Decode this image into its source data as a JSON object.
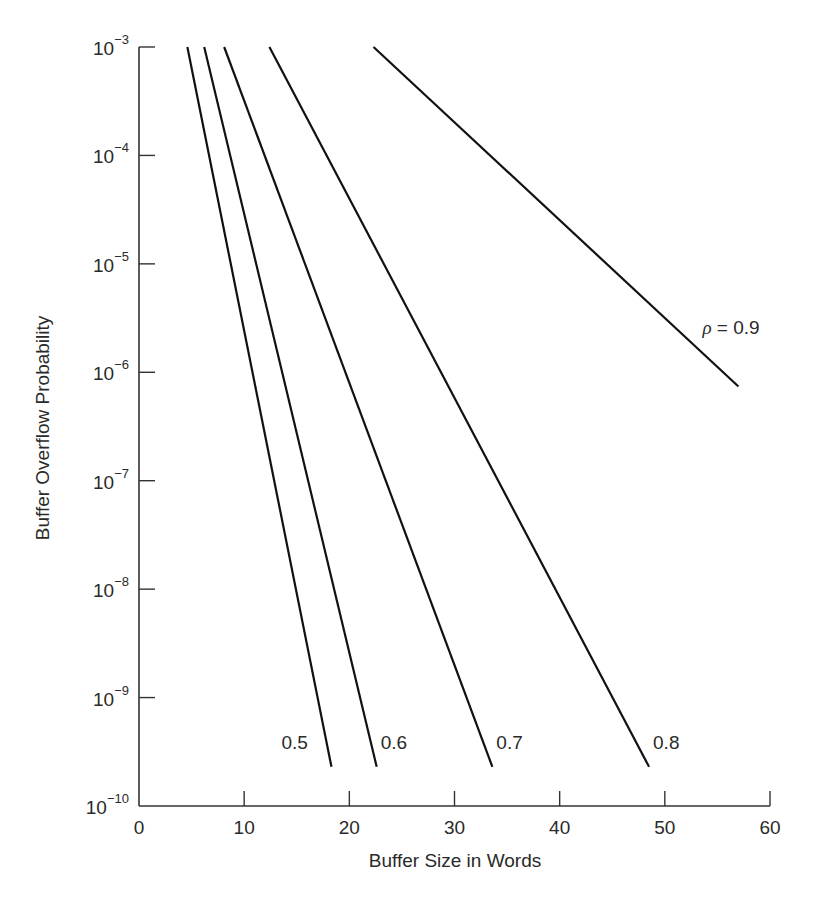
{
  "chart_data": {
    "type": "line",
    "title": "",
    "xlabel": "Buffer Size in Words",
    "ylabel": "Buffer Overflow Probability",
    "xlim": [
      0,
      60
    ],
    "ylim": [
      1e-10,
      0.001
    ],
    "yscale": "log",
    "grid": false,
    "x_ticks": [
      "0",
      "10",
      "20",
      "30",
      "40",
      "50",
      "60"
    ],
    "y_ticks": [
      {
        "base": "10",
        "exp": "−3"
      },
      {
        "base": "10",
        "exp": "−4"
      },
      {
        "base": "10",
        "exp": "−5"
      },
      {
        "base": "10",
        "exp": "−6"
      },
      {
        "base": "10",
        "exp": "−7"
      },
      {
        "base": "10",
        "exp": "−8"
      },
      {
        "base": "10",
        "exp": "−9"
      },
      {
        "base": "10",
        "exp": "−10"
      }
    ],
    "series": [
      {
        "name": "0.5",
        "label": "0.5",
        "x": [
          4.6,
          18.3
        ],
        "y": [
          0.001,
          2.3e-10
        ]
      },
      {
        "name": "0.6",
        "label": "0.6",
        "x": [
          6.2,
          22.6
        ],
        "y": [
          0.001,
          2.3e-10
        ]
      },
      {
        "name": "0.7",
        "label": "0.7",
        "x": [
          8.1,
          33.6
        ],
        "y": [
          0.001,
          2.3e-10
        ]
      },
      {
        "name": "0.8",
        "label": "0.8",
        "x": [
          12.4,
          48.5
        ],
        "y": [
          0.001,
          2.3e-10
        ]
      },
      {
        "name": "0.9",
        "label": "ρ = 0.9",
        "x": [
          22.3,
          57.0
        ],
        "y": [
          0.001,
          7.4e-07
        ]
      }
    ],
    "legend_position": "inline labels at line ends"
  }
}
